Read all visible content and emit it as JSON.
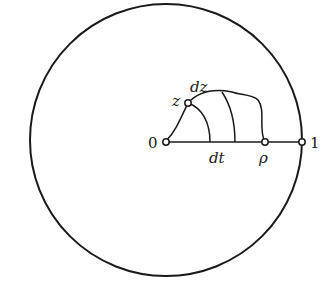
{
  "diagram": {
    "type": "unit-disk-path",
    "colors": {
      "stroke": "#1a1a1a",
      "background": "#ffffff"
    },
    "circle": {
      "cx": 166,
      "cy": 140,
      "r": 136
    },
    "points": {
      "origin": {
        "label": "0",
        "x": 166,
        "y": 141
      },
      "z": {
        "label": "z",
        "x": 188,
        "y": 103
      },
      "rho": {
        "label": "ρ",
        "x": 265,
        "y": 142
      },
      "one": {
        "label": "1",
        "x": 302,
        "y": 142
      }
    },
    "labels": {
      "dz": "dz",
      "dt": "dt"
    }
  }
}
